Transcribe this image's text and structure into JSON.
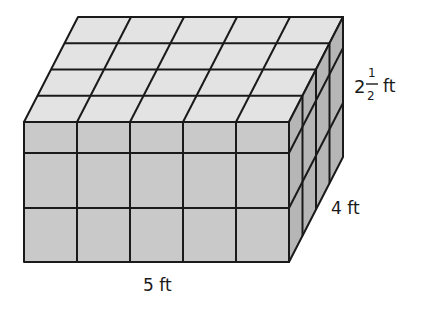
{
  "figure": {
    "cubes": {
      "length": 5,
      "depth": 4,
      "height": 2.5
    },
    "colors": {
      "front": "#c9c9c9",
      "top": "#e3e3e3",
      "right": "#b6b6b6",
      "edge": "#1a1a1a"
    }
  },
  "labels": {
    "length": "5 ft",
    "depth": "4 ft",
    "height_whole": "2",
    "height_numerator": "1",
    "height_denominator": "2",
    "height_unit": "ft"
  }
}
